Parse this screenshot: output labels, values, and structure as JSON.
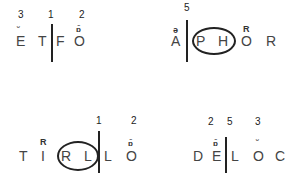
{
  "panels": [
    {
      "numbers": [
        "3",
        "1",
        "2"
      ],
      "letters": [
        "E",
        "T",
        "F",
        "O"
      ],
      "diacritics": [
        "˘",
        "ɒ̄"
      ]
    },
    {
      "numbers": [
        "5"
      ],
      "letters": [
        "A",
        "P",
        "H",
        "O",
        "R"
      ],
      "diacritics": [
        "ə",
        "R"
      ]
    },
    {
      "numbers": [
        "1",
        "2"
      ],
      "letters": [
        "T",
        "I",
        "R",
        "L",
        "L",
        "O"
      ],
      "diacritics": [
        "R",
        "ɒ̄"
      ]
    },
    {
      "numbers": [
        "2",
        "5",
        "3"
      ],
      "letters": [
        "D",
        "E",
        "L",
        "O",
        "C"
      ],
      "diacritics": [
        "ɒ̄",
        "˘"
      ]
    }
  ]
}
